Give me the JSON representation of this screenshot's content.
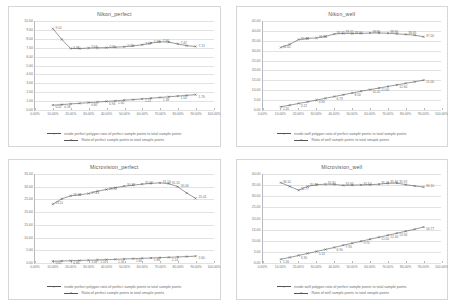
{
  "page": {
    "background": "#ffffff",
    "sheet_border": "#d6d6d6",
    "series_color": "#555555",
    "grid_color": "#e2e2e2"
  },
  "legend_labels": {
    "perfect_inside": "inside perfect polygon ratio of perfect sample points to total sample points",
    "perfect_ratio": "Ratio of perfect sample points to total smaple points",
    "well_inside": "inside well polygon ratio of perfect sample points to total sample points",
    "well_ratio": "Ratio of well sample points to total smaple points"
  },
  "chart_data": [
    {
      "id": "nikon-perfect",
      "type": "line",
      "title": "Nikon_perfect",
      "xlabel": "",
      "ylabel": "",
      "grid": true,
      "legend_position": "bottom",
      "xlim": [
        0,
        100
      ],
      "ylim": [
        0,
        10
      ],
      "ytick_step": 1,
      "xtick_labels": [
        "0.00%",
        "10.00%",
        "20.00%",
        "30.00%",
        "40.00%",
        "50.00%",
        "60.00%",
        "70.00%",
        "80.00%",
        "90.00%",
        "100.00%"
      ],
      "ytick_labels": [
        "0.00",
        "1.00",
        "2.00",
        "3.00",
        "4.00",
        "5.00",
        "6.00",
        "7.00",
        "8.00",
        "9.00",
        "10.00"
      ],
      "x": [
        10,
        15,
        20,
        25,
        30,
        35,
        40,
        45,
        50,
        55,
        60,
        65,
        70,
        75,
        80,
        85,
        90
      ],
      "series": [
        {
          "name": "inside perfect polygon ratio of perfect sample points to total sample points",
          "values": [
            9.14,
            7.92,
            6.9,
            6.89,
            6.96,
            6.98,
            7.0,
            7.05,
            7.1,
            7.2,
            7.32,
            7.52,
            7.66,
            7.62,
            7.42,
            7.22,
            7.13
          ],
          "labels": [
            "9.14",
            "",
            "6.88",
            "",
            "7.04",
            "",
            "7.05",
            "",
            "7.02",
            "",
            "7.32",
            "7.46",
            "7.66",
            "",
            "7.42",
            "",
            "7.13"
          ]
        },
        {
          "name": "Ratio of perfect sample points to total smaple points",
          "values": [
            0.52,
            0.58,
            0.66,
            0.72,
            0.8,
            0.86,
            0.94,
            1.0,
            1.08,
            1.14,
            1.22,
            1.3,
            1.38,
            1.46,
            1.54,
            1.62,
            1.7
          ],
          "labels": [
            "0.52",
            "0.58",
            "",
            "",
            "0.80",
            "",
            "0.94",
            "1.00",
            "",
            "",
            "1.22",
            "",
            "1.38",
            "",
            "1.54",
            "",
            "1.70"
          ]
        }
      ]
    },
    {
      "id": "nikon-well",
      "type": "line",
      "title": "Nikon_well",
      "xlabel": "",
      "ylabel": "",
      "grid": true,
      "legend_position": "bottom",
      "xlim": [
        0,
        100
      ],
      "ylim": [
        0,
        45
      ],
      "ytick_step": 5,
      "xtick_labels": [
        "0.00%",
        "10.00%",
        "20.00%",
        "30.00%",
        "40.00%",
        "50.00%",
        "60.00%",
        "70.00%",
        "80.00%",
        "90.00%",
        "100.00%"
      ],
      "ytick_labels": [
        "0.00",
        "5.00",
        "10.00",
        "15.00",
        "20.00",
        "25.00",
        "30.00",
        "35.00",
        "40.00",
        "45.00"
      ],
      "x": [
        10,
        15,
        20,
        25,
        30,
        35,
        40,
        45,
        50,
        55,
        60,
        65,
        70,
        75,
        80,
        85,
        90
      ],
      "series": [
        {
          "name": "inside well polygon ratio of perfect sample points to total sample points",
          "values": [
            31.6,
            33.2,
            35.6,
            36.2,
            36.4,
            37.2,
            38.4,
            38.7,
            38.6,
            38.7,
            38.9,
            38.9,
            38.8,
            38.5,
            38.2,
            37.8,
            37.0
          ],
          "labels": [
            "31.61",
            "",
            "35.66",
            "",
            "36.34",
            "",
            "38.42",
            "38.65",
            "38.60",
            "",
            "38.86",
            "",
            "38.80",
            "",
            "38.46",
            "",
            "37.00"
          ]
        },
        {
          "name": "Ratio of well sample points to total smaple points",
          "values": [
            1.5,
            2.3,
            3.2,
            4.0,
            4.9,
            5.8,
            6.7,
            7.6,
            8.5,
            9.4,
            10.2,
            11.0,
            11.8,
            12.6,
            13.4,
            14.2,
            15.0
          ],
          "labels": [
            "1.50",
            "",
            "3.22",
            "",
            "4.90",
            "",
            "6.73",
            "",
            "8.50",
            "",
            "10.20",
            "11.00",
            "",
            "12.60",
            "",
            "",
            "15.00"
          ]
        }
      ]
    },
    {
      "id": "microvision-perfect",
      "type": "line",
      "title": "Microvision_perfect",
      "xlabel": "",
      "ylabel": "",
      "grid": true,
      "legend_position": "bottom",
      "xlim": [
        0,
        100
      ],
      "ylim": [
        0,
        35
      ],
      "ytick_step": 5,
      "xtick_labels": [
        "0.00%",
        "10.00%",
        "20.00%",
        "30.00%",
        "40.00%",
        "50.00%",
        "60.00%",
        "70.00%",
        "80.00%",
        "90.00%",
        "100.00%"
      ],
      "ytick_labels": [
        "0.00",
        "5.00",
        "10.00",
        "15.00",
        "20.00",
        "25.00",
        "30.00",
        "35.00"
      ],
      "x": [
        10,
        15,
        20,
        25,
        30,
        35,
        40,
        45,
        50,
        55,
        60,
        65,
        70,
        75,
        80,
        85,
        90
      ],
      "series": [
        {
          "name": "inside perfect polygon ratio of perfect sample points to total sample points",
          "values": [
            23.1,
            25.2,
            26.4,
            26.8,
            27.3,
            28.2,
            28.9,
            29.6,
            30.2,
            30.6,
            31.0,
            31.3,
            31.5,
            31.2,
            30.0,
            27.5,
            25.4
          ],
          "labels": [
            "23.11",
            "",
            "26.41",
            "",
            "27.32",
            "",
            "28.92",
            "",
            "30.22",
            "",
            "31.03",
            "",
            "31.50",
            "31.20",
            "30.46",
            "",
            "25.41"
          ]
        },
        {
          "name": "Ratio of perfect sample points to total smaple points",
          "values": [
            0.62,
            0.7,
            0.8,
            0.9,
            1.0,
            1.1,
            1.22,
            1.34,
            1.48,
            1.6,
            1.74,
            1.86,
            2.0,
            2.14,
            2.28,
            2.44,
            2.6
          ],
          "labels": [
            "0.62",
            "",
            "0.80",
            "",
            "1.00",
            "1.10",
            "",
            "1.34",
            "",
            "1.60",
            "",
            "1.86",
            "",
            "2.14",
            "",
            "",
            "2.60"
          ]
        }
      ]
    },
    {
      "id": "microvision-well",
      "type": "line",
      "title": "Microvision_well",
      "xlabel": "",
      "ylabel": "",
      "grid": true,
      "legend_position": "bottom",
      "xlim": [
        0,
        100
      ],
      "ylim": [
        0,
        40
      ],
      "ytick_step": 5,
      "xtick_labels": [
        "0.00%",
        "10.00%",
        "20.00%",
        "30.00%",
        "40.00%",
        "50.00%",
        "60.00%",
        "70.00%",
        "80.00%",
        "90.00%",
        "100.00%"
      ],
      "ytick_labels": [
        "0.00",
        "5.00",
        "10.00",
        "15.00",
        "20.00",
        "25.00",
        "30.00",
        "35.00",
        "40.00"
      ],
      "x": [
        10,
        15,
        20,
        25,
        30,
        35,
        40,
        45,
        50,
        55,
        60,
        65,
        70,
        75,
        80,
        85,
        90
      ],
      "series": [
        {
          "name": "inside well polygon ratio of perfect sample points to total sample points",
          "values": [
            36.1,
            34.4,
            32.7,
            34.4,
            35.2,
            35.4,
            35.3,
            34.9,
            35.0,
            35.1,
            35.2,
            35.4,
            35.8,
            35.9,
            35.2,
            34.6,
            34.1
          ],
          "labels": [
            "36.10",
            "",
            "32.77",
            "35.19",
            "",
            "35.30",
            "",
            "34.94",
            "",
            "35.10",
            "",
            "35.42",
            "35.80",
            "35.92",
            "",
            "",
            "34.10"
          ]
        },
        {
          "name": "Ratio of well sample points to total smaple points",
          "values": [
            1.56,
            2.4,
            3.3,
            4.2,
            5.1,
            6.0,
            6.9,
            7.9,
            8.8,
            9.7,
            10.6,
            11.5,
            12.4,
            13.3,
            14.2,
            15.1,
            16.1
          ],
          "labels": [
            "1.56",
            "",
            "3.30",
            "",
            "5.10",
            "",
            "6.90",
            "7.90",
            "",
            "9.70",
            "",
            "11.50",
            "12.40",
            "13.30",
            "",
            "",
            "16.77"
          ]
        }
      ]
    }
  ]
}
